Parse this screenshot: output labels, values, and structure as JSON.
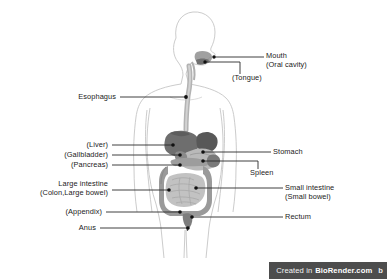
{
  "figure": {
    "background_color": "#ffffff",
    "body_outline_color": "#c9c9c9",
    "leader_line_color": "#2b2b2b",
    "text_color": "#1b1b1b",
    "organ_colors": {
      "liver": "#6e6e6e",
      "stomach_upper": "#585858",
      "stomach_body": "#b9b9b9",
      "gallbladder": "#8a8a8a",
      "pancreas": "#9d9d9d",
      "spleen": "#7a7a7a",
      "colon": "#9a9a9a",
      "small_intestine": "#c2c2c2",
      "esophagus": "#b3b3b3",
      "oral_cavity": "#8f8f8f",
      "rectum": "#7d7d7d"
    }
  },
  "labels": {
    "mouth": {
      "line1": "Mouth",
      "line2": "(Oral cavity)"
    },
    "tongue": {
      "line1": "(Tongue)"
    },
    "esophagus": {
      "line1": "Esophagus"
    },
    "liver": {
      "line1": "(Liver)"
    },
    "gallbladder": {
      "line1": "(Gallbladder)"
    },
    "pancreas": {
      "line1": "(Pancreas)"
    },
    "large_intestine": {
      "line1": "Large intestine",
      "line2": "(Colon,Large bowel)"
    },
    "appendix": {
      "line1": "(Appendix)"
    },
    "anus": {
      "line1": "Anus"
    },
    "stomach": {
      "line1": "Stomach"
    },
    "spleen": {
      "line1": "Spleen"
    },
    "small_intestine": {
      "line1": "Small intestine",
      "line2": "(Small bowel)"
    },
    "rectum": {
      "line1": "Rectum"
    }
  },
  "watermark": {
    "prefix": "Created in",
    "brand": "BioRender.com",
    "tail": "b"
  }
}
